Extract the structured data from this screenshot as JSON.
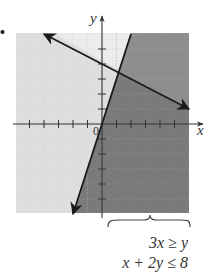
{
  "chart_data": {
    "type": "region",
    "title": "",
    "xlabel": "x",
    "ylabel": "y",
    "origin_label": "0",
    "xlim": [
      -6,
      6
    ],
    "ylim": [
      -6,
      6
    ],
    "tick_step": 1,
    "grid": true,
    "boundary_lines": [
      {
        "equation": "3x = y",
        "inequality": "3x ≥ y",
        "style": "solid",
        "points": [
          [
            -2,
            -6
          ],
          [
            2,
            6
          ]
        ],
        "arrow_start": true,
        "arrow_end": false
      },
      {
        "equation": "x + 2y = 8",
        "inequality": "x + 2y ≤ 8",
        "style": "solid",
        "points": [
          [
            6,
            1
          ],
          [
            -4,
            6
          ]
        ],
        "arrow_start": true,
        "arrow_end": true
      }
    ],
    "regions": [
      {
        "name": "neither-above-line2-left-of-line1",
        "shade": "#ececec"
      },
      {
        "name": "only-x+2y<=8",
        "shade": "#dedede"
      },
      {
        "name": "only-3x>=y",
        "shade": "#8e8e8e"
      },
      {
        "name": "solution-both",
        "shade": "#7a7a7a"
      }
    ],
    "system_label": [
      "3x ≥ y",
      "x + 2y ≤ 8"
    ]
  },
  "labels": {
    "x_axis": "x",
    "y_axis": "y",
    "origin": "0",
    "ineq1": "3x ≥ y",
    "ineq2": "x + 2y ≤ 8"
  },
  "colors": {
    "line": "#1a1a1a",
    "axis": "#333333",
    "grid": "#c8c8c8",
    "grid_dark": "#858585"
  }
}
